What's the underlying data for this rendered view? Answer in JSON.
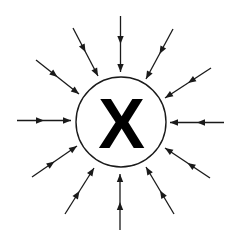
{
  "diagram": {
    "center_label": "X",
    "colors": {
      "background": "#ffffff",
      "stroke": "#1a1a1a",
      "label": "#000000"
    },
    "circle": {
      "cx": 121,
      "cy": 122,
      "r": 45
    },
    "arrows": [
      {
        "id": "top",
        "x1": 120.5,
        "y1": 16,
        "x2": 120.5,
        "y2": 72
      },
      {
        "id": "top-right",
        "x1": 173,
        "y1": 29,
        "x2": 146,
        "y2": 79
      },
      {
        "id": "right-upper",
        "x1": 211,
        "y1": 68,
        "x2": 165,
        "y2": 98
      },
      {
        "id": "right",
        "x1": 224,
        "y1": 122.5,
        "x2": 170,
        "y2": 122.5
      },
      {
        "id": "right-lower",
        "x1": 210,
        "y1": 178,
        "x2": 165,
        "y2": 148
      },
      {
        "id": "bottom-right",
        "x1": 174,
        "y1": 214,
        "x2": 146,
        "y2": 167
      },
      {
        "id": "bottom",
        "x1": 120,
        "y1": 230,
        "x2": 120,
        "y2": 174
      },
      {
        "id": "bottom-left",
        "x1": 65,
        "y1": 214,
        "x2": 94,
        "y2": 168
      },
      {
        "id": "left-lower",
        "x1": 32,
        "y1": 177,
        "x2": 77,
        "y2": 146
      },
      {
        "id": "left",
        "x1": 17,
        "y1": 120.5,
        "x2": 71,
        "y2": 120.5
      },
      {
        "id": "left-upper",
        "x1": 36,
        "y1": 60,
        "x2": 79,
        "y2": 94
      },
      {
        "id": "top-left",
        "x1": 73,
        "y1": 28,
        "x2": 98,
        "y2": 76
      }
    ]
  }
}
